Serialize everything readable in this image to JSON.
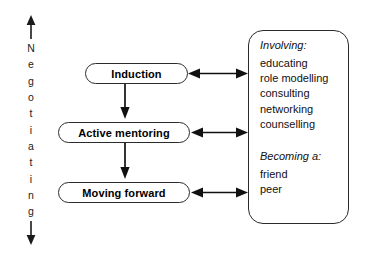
{
  "axis": {
    "name": "Negotiating",
    "letters": [
      "N",
      "e",
      "g",
      "o",
      "t",
      "i",
      "a",
      "t",
      "i",
      "n",
      "g"
    ],
    "top_arrow": "up-arrow",
    "bottom_arrow": "down-arrow"
  },
  "stages": [
    {
      "id": "induction",
      "label": "Induction"
    },
    {
      "id": "active-mentoring",
      "label": "Active mentoring"
    },
    {
      "id": "moving-forward",
      "label": "Moving forward"
    }
  ],
  "panel": {
    "involving": {
      "heading": "Involving:",
      "items": [
        "educating",
        "role modelling",
        "consulting",
        "networking",
        "counselling"
      ]
    },
    "becoming": {
      "heading": "Becoming a:",
      "items": [
        "friend",
        "peer"
      ]
    }
  },
  "colors": {
    "stroke": "#2b2b2b",
    "text": "#111111",
    "background": "#ffffff"
  }
}
